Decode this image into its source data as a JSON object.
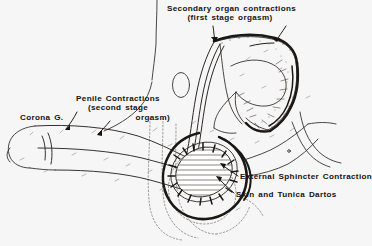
{
  "figure": {
    "background_color": "#f7f6f6",
    "ink_color": "#14120f",
    "line_color": "#2a2724",
    "dotted_color": "#6d6a68"
  },
  "labels": {
    "secondary_organ": {
      "line1": "Secondary organ contractions",
      "line2": "(first stage orgasm)"
    },
    "penile_contractions": {
      "line1": "Penile Contractions",
      "line2": "(second stage",
      "line3": "orgasm)"
    },
    "corona": {
      "text": "Corona G."
    },
    "external_sphincter": {
      "text": "External Sphincter Contraction"
    },
    "skin_tunica_dartos": {
      "text": "Skin and Tunica Dartos"
    }
  },
  "annotations": {
    "leader_line_count": 6,
    "arrow_count": 4
  }
}
